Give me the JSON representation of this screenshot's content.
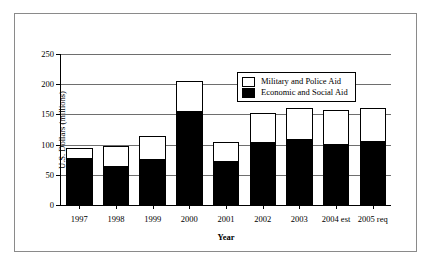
{
  "chart_data": {
    "type": "bar",
    "subtype": "stacked",
    "title": "",
    "xlabel": "Year",
    "ylabel": "U.S. Dollars (millions)",
    "ylim": [
      0,
      250
    ],
    "yticks": [
      0,
      50,
      100,
      150,
      200,
      250
    ],
    "grid": true,
    "legend_position": "top-right-inside",
    "categories": [
      "1997",
      "1998",
      "1999",
      "2000",
      "2001",
      "2002",
      "2003",
      "2004 est",
      "2005 req"
    ],
    "series": [
      {
        "name": "Economic and Social Aid",
        "color": "#000000",
        "values": [
          78,
          64,
          75,
          155,
          72,
          103,
          108,
          100,
          105
        ]
      },
      {
        "name": "Military and Police Aid",
        "color": "#ffffff",
        "values": [
          17,
          33,
          40,
          51,
          33,
          50,
          52,
          57,
          55
        ]
      }
    ],
    "totals": [
      95,
      97,
      115,
      206,
      105,
      153,
      160,
      157,
      160
    ]
  },
  "axis": {
    "y_tick_labels": [
      "250",
      "200",
      "150",
      "100",
      "50",
      "0"
    ],
    "y_title": "U.S. Dollars (millions)",
    "x_title": "Year"
  },
  "legend": {
    "items": [
      {
        "label": "Military and Police Aid",
        "swatch": "empty"
      },
      {
        "label": "Economic and Social Aid",
        "swatch": "filled"
      }
    ]
  }
}
